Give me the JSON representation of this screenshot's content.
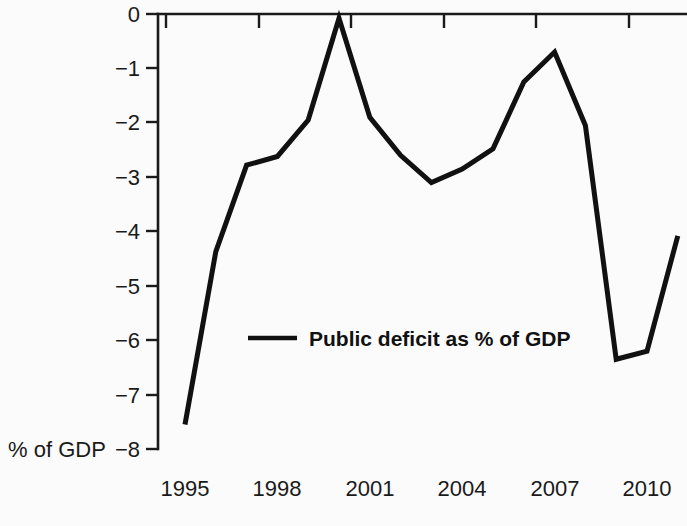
{
  "chart_data": {
    "type": "line",
    "title": "",
    "subtitle": "",
    "xlabel": "",
    "ylabel": "% of GDP",
    "ylim": [
      -8,
      0
    ],
    "xlim": [
      1995,
      2011
    ],
    "grid": false,
    "legend_position": "center",
    "x": [
      1995,
      1996,
      1997,
      1998,
      1999,
      2000,
      2001,
      2002,
      2003,
      2004,
      2005,
      2006,
      2007,
      2008,
      2009,
      2010,
      2011
    ],
    "series": [
      {
        "name": "Public deficit as % of GDP",
        "color": "#111111",
        "values": [
          -7.55,
          -4.37,
          -2.78,
          -2.62,
          -1.95,
          -0.08,
          -1.9,
          -2.6,
          -3.1,
          -2.85,
          -2.48,
          -1.25,
          -0.7,
          -2.05,
          -6.35,
          -6.2,
          -4.08
        ]
      }
    ],
    "y_ticks": [
      0,
      -1,
      -2,
      -3,
      -4,
      -5,
      -6,
      -7,
      -8
    ],
    "y_tick_labels": [
      "0",
      "−1",
      "−2",
      "−3",
      "−4",
      "−5",
      "−6",
      "−7",
      "−8"
    ],
    "x_ticks": [
      1995,
      1998,
      2001,
      2004,
      2007,
      2010
    ],
    "x_tick_labels": [
      "1995",
      "1998",
      "2001",
      "2004",
      "2007",
      "2010"
    ],
    "legend_entries": [
      "Public deficit as % of GDP"
    ],
    "axis_title_y": "% of GDP"
  },
  "axis": {
    "y_label_0": "0",
    "y_label_1": "−1",
    "y_label_2": "−2",
    "y_label_3": "−3",
    "y_label_4": "−4",
    "y_label_5": "−5",
    "y_label_6": "−6",
    "y_label_7": "−7",
    "y_label_8": "−8",
    "x_label_0": "1995",
    "x_label_1": "1998",
    "x_label_2": "2001",
    "x_label_3": "2004",
    "x_label_4": "2007",
    "x_label_5": "2010",
    "unit_label": "% of GDP"
  },
  "legend": {
    "entry_label": "Public deficit as % of GDP"
  },
  "colors": {
    "line": "#111111",
    "axis": "#1a1a1a",
    "text": "#1a1a1a",
    "background": "#fbfbfb"
  }
}
